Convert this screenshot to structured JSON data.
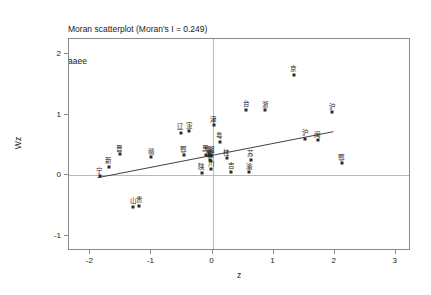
{
  "chart_data": {
    "type": "scatter",
    "title": "Moran scatterplot (Moran's I = 0.249)",
    "subtitle": "aaee",
    "morans_i": 0.249,
    "xlabel": "z",
    "ylabel": "Wz",
    "xlim": [
      -2.35,
      3.25
    ],
    "ylim": [
      -1.25,
      2.25
    ],
    "xticks": [
      -2,
      -1,
      0,
      1,
      2,
      3
    ],
    "xticklabels": [
      "-2",
      "-1",
      "0",
      "1",
      "2",
      "3"
    ],
    "yticks": [
      -1,
      0,
      1,
      2
    ],
    "yticklabels": [
      "-1",
      "0",
      "1",
      "2"
    ],
    "grid": false,
    "legend": false,
    "reference_lines": {
      "vertical_x": 0,
      "horizontal_y": 0,
      "color": "#b9b9b9"
    },
    "fit_line": {
      "x0": -1.88,
      "y0": -0.04,
      "x1": 1.98,
      "y1": 0.72,
      "slope": 0.249,
      "color": "#2b2b2b"
    },
    "points": [
      {
        "label": "京",
        "x": 1.33,
        "y": 1.66
      },
      {
        "label": "沪",
        "x": 1.96,
        "y": 1.04
      },
      {
        "label": "台",
        "x": 0.55,
        "y": 1.08
      },
      {
        "label": "浙",
        "x": 0.86,
        "y": 1.07
      },
      {
        "label": "津",
        "x": 0.02,
        "y": 0.83
      },
      {
        "label": "辽",
        "x": -0.52,
        "y": 0.7
      },
      {
        "label": "寁",
        "x": -0.38,
        "y": 0.73
      },
      {
        "label": "粤",
        "x": 0.12,
        "y": 0.55
      },
      {
        "label": "沪",
        "x": 1.52,
        "y": 0.6
      },
      {
        "label": "闽",
        "x": 1.72,
        "y": 0.58
      },
      {
        "label": "晋",
        "x": -1.52,
        "y": 0.35
      },
      {
        "label": "赣",
        "x": -1.0,
        "y": 0.3
      },
      {
        "label": "鄂",
        "x": -0.47,
        "y": 0.33
      },
      {
        "label": "黑",
        "x": -0.11,
        "y": 0.34
      },
      {
        "label": "鲁",
        "x": -0.06,
        "y": 0.33
      },
      {
        "label": "湘",
        "x": -0.02,
        "y": 0.32
      },
      {
        "label": "豫",
        "x": -0.04,
        "y": 0.26
      },
      {
        "label": "冀",
        "x": -0.03,
        "y": 0.24
      },
      {
        "label": "桂",
        "x": 0.23,
        "y": 0.28
      },
      {
        "label": "苏",
        "x": 0.63,
        "y": 0.26
      },
      {
        "label": "新",
        "x": -1.7,
        "y": 0.14
      },
      {
        "label": "川",
        "x": -0.02,
        "y": 0.1
      },
      {
        "label": "陕",
        "x": -0.18,
        "y": 0.04
      },
      {
        "label": "吉",
        "x": 0.31,
        "y": 0.06
      },
      {
        "label": "渝",
        "x": 0.6,
        "y": 0.05
      },
      {
        "label": "鄂",
        "x": 2.12,
        "y": 0.2
      },
      {
        "label": "宁",
        "x": -1.85,
        "y": -0.02
      },
      {
        "label": "山",
        "x": -1.3,
        "y": -0.52
      },
      {
        "label": "贵",
        "x": -1.2,
        "y": -0.5
      }
    ]
  }
}
